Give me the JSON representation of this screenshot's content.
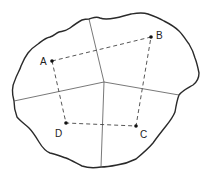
{
  "diagram": {
    "type": "thiessen-polygons",
    "colors": {
      "boundary": "#2a2a2a",
      "polygon_edges": "#555555",
      "connectors": "#444444",
      "points": "#111111",
      "labels": "#222222",
      "background": "#ffffff"
    },
    "stations": [
      {
        "id": "A",
        "label": "A",
        "x": 52,
        "y": 61,
        "label_x": 40,
        "label_y": 65
      },
      {
        "id": "B",
        "label": "B",
        "x": 151,
        "y": 37,
        "label_x": 156,
        "label_y": 39
      },
      {
        "id": "C",
        "label": "C",
        "x": 136,
        "y": 126,
        "label_x": 140,
        "label_y": 138
      },
      {
        "id": "D",
        "label": "D",
        "x": 66,
        "y": 123,
        "label_x": 55,
        "label_y": 137
      }
    ],
    "connector_order": [
      "A",
      "B",
      "C",
      "D"
    ],
    "polygon_junction": {
      "x": 104,
      "y": 82
    },
    "polygon_edge_endpoints": [
      {
        "to": "top",
        "x": 89,
        "y": 19
      },
      {
        "to": "right",
        "x": 179,
        "y": 95
      },
      {
        "to": "bottom",
        "x": 101,
        "y": 167
      },
      {
        "to": "left",
        "x": 14,
        "y": 101
      }
    ]
  }
}
